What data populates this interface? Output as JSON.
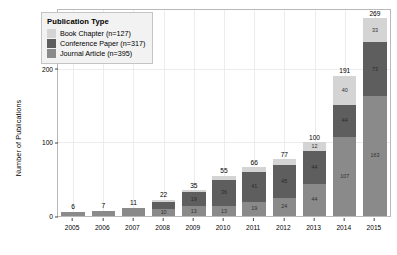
{
  "chart_data": {
    "type": "bar",
    "barmode": "stacked",
    "title": "",
    "xlabel": "",
    "ylabel": "Number of Publications",
    "categories": [
      "2005",
      "2006",
      "2007",
      "2008",
      "2009",
      "2010",
      "2011",
      "2012",
      "2013",
      "2014",
      "2015"
    ],
    "ylim": [
      0,
      280
    ],
    "yticks": [
      "0",
      "100",
      "200"
    ],
    "ytick_values": [
      0,
      100,
      200
    ],
    "grid": true,
    "legend_position": "top-left",
    "legend_title": "Publication Type",
    "series": [
      {
        "name": "Journal Article (n=395)",
        "short_name": "Journal Article",
        "n": 395,
        "color": "#8a8a8a",
        "stack_order": 0,
        "values": [
          6,
          7,
          11,
          10,
          13,
          13,
          19,
          24,
          44,
          107,
          163
        ],
        "labels": [
          "",
          "",
          "",
          "10",
          "13",
          "13",
          "19",
          "24",
          "44",
          "107",
          "163"
        ]
      },
      {
        "name": "Conference Paper (n=317)",
        "short_name": "Conference Paper",
        "n": 317,
        "color": "#5e5e5e",
        "stack_order": 1,
        "values": [
          0,
          0,
          0,
          9,
          19,
          36,
          41,
          45,
          44,
          44,
          73
        ],
        "labels": [
          "",
          "",
          "",
          "",
          "19",
          "36",
          "41",
          "45",
          "44",
          "44",
          "73"
        ]
      },
      {
        "name": "Book Chapter (n=127)",
        "short_name": "Book Chapter",
        "n": 127,
        "color": "#d4d4d4",
        "stack_order": 2,
        "values": [
          0,
          0,
          0,
          3,
          3,
          6,
          6,
          8,
          12,
          40,
          33
        ],
        "labels": [
          "",
          "",
          "",
          "",
          "",
          "",
          "",
          "",
          "12",
          "40",
          "33"
        ]
      }
    ],
    "totals": [
      6,
      7,
      11,
      22,
      35,
      55,
      66,
      77,
      100,
      191,
      269
    ],
    "total_labels": [
      "6",
      "7",
      "11",
      "22",
      "35",
      "55",
      "66",
      "77",
      "100",
      "191",
      "269"
    ]
  },
  "legend": {
    "title": "Publication Type",
    "items": [
      {
        "label": "Book Chapter (n=127)",
        "color": "#d4d4d4"
      },
      {
        "label": "Conference Paper (n=317)",
        "color": "#5e5e5e"
      },
      {
        "label": "Journal Article (n=395)",
        "color": "#8a8a8a"
      }
    ]
  }
}
